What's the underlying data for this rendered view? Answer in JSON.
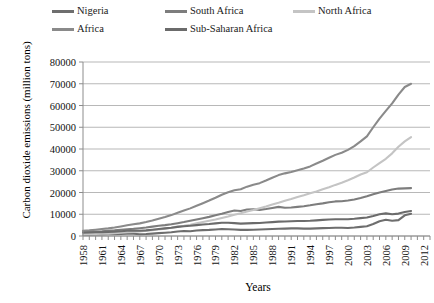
{
  "chart_data": {
    "type": "line",
    "title": "",
    "xlabel": "Years",
    "ylabel": "Carbon dioxide emissions (million tons)",
    "ylim": [
      0,
      80000
    ],
    "ytick_labels": [
      "80000",
      "70000",
      "60000",
      "50000",
      "40000",
      "30000",
      "20000",
      "10000",
      "0"
    ],
    "ytick_values": [
      80000,
      70000,
      60000,
      50000,
      40000,
      30000,
      20000,
      10000,
      0
    ],
    "xlim": [
      1958,
      2013
    ],
    "xtick_labels": [
      "1958",
      "1961",
      "1964",
      "1967",
      "1970",
      "1973",
      "1976",
      "1979",
      "1982",
      "1985",
      "1988",
      "1991",
      "1994",
      "1997",
      "2000",
      "2003",
      "2006",
      "2009",
      "2012"
    ],
    "xtick_values": [
      1958,
      1961,
      1964,
      1967,
      1970,
      1973,
      1976,
      1979,
      1982,
      1985,
      1988,
      1991,
      1994,
      1997,
      2000,
      2003,
      2006,
      2009,
      2012
    ],
    "grid": "horizontal",
    "legend_position": "top",
    "x": [
      1958,
      1959,
      1960,
      1961,
      1962,
      1963,
      1964,
      1965,
      1966,
      1967,
      1968,
      1969,
      1970,
      1971,
      1972,
      1973,
      1974,
      1975,
      1976,
      1977,
      1978,
      1979,
      1980,
      1981,
      1982,
      1983,
      1984,
      1985,
      1986,
      1987,
      1988,
      1989,
      1990,
      1991,
      1992,
      1993,
      1994,
      1995,
      1996,
      1997,
      1998,
      1999,
      2000,
      2001,
      2002,
      2003,
      2004,
      2005,
      2006,
      2007,
      2008,
      2009,
      2010
    ],
    "series": [
      {
        "name": "Nigeria",
        "color": "#6e6e6e",
        "values": [
          600,
          650,
          700,
          750,
          800,
          850,
          900,
          1000,
          1000,
          800,
          900,
          1100,
          1300,
          1500,
          1700,
          2100,
          2300,
          2200,
          2500,
          2700,
          2800,
          3000,
          3200,
          3100,
          3000,
          2800,
          2800,
          2900,
          3000,
          3100,
          3200,
          3300,
          3400,
          3500,
          3500,
          3400,
          3400,
          3500,
          3600,
          3700,
          3800,
          3800,
          3700,
          3900,
          4200,
          4500,
          5500,
          6800,
          7500,
          7000,
          7300,
          9500,
          10200
        ]
      },
      {
        "name": "South Africa",
        "color": "#7d7d7d",
        "values": [
          1900,
          2000,
          2100,
          2200,
          2400,
          2600,
          2900,
          3100,
          3300,
          3600,
          3900,
          4300,
          4700,
          5000,
          5400,
          5900,
          6400,
          7000,
          7600,
          8200,
          8800,
          9500,
          10200,
          11000,
          11700,
          11500,
          12200,
          12300,
          12000,
          12400,
          12900,
          13400,
          13000,
          13100,
          13400,
          13700,
          14100,
          14600,
          15000,
          15500,
          15900,
          16000,
          16300,
          16800,
          17500,
          18300,
          19200,
          20000,
          20700,
          21400,
          21800,
          21900,
          22000
        ]
      },
      {
        "name": "North Africa",
        "color": "#c4c4c4",
        "values": [
          700,
          800,
          900,
          1000,
          1100,
          1300,
          1500,
          1700,
          1900,
          2100,
          2400,
          2700,
          3000,
          3400,
          3800,
          4300,
          4700,
          5200,
          5800,
          6400,
          7000,
          7600,
          8300,
          9000,
          9800,
          10500,
          11300,
          12000,
          12800,
          13600,
          14500,
          15300,
          16200,
          17000,
          17900,
          18700,
          19600,
          20500,
          21500,
          22400,
          23500,
          24500,
          25600,
          26900,
          28300,
          29300,
          31500,
          33500,
          35500,
          38000,
          41000,
          43500,
          45500
        ]
      },
      {
        "name": "Africa",
        "color": "#8a8a8a",
        "values": [
          2400,
          2600,
          2900,
          3200,
          3500,
          3900,
          4400,
          4900,
          5400,
          5800,
          6400,
          7100,
          7900,
          8700,
          9600,
          10700,
          11700,
          12700,
          13900,
          15100,
          16300,
          17600,
          19000,
          20100,
          21000,
          21500,
          22700,
          23600,
          24300,
          25500,
          26800,
          28000,
          28800,
          29400,
          30200,
          31000,
          32000,
          33300,
          34600,
          36000,
          37300,
          38300,
          39600,
          41300,
          43500,
          45800,
          50000,
          54000,
          57500,
          61000,
          65000,
          68500,
          70000
        ]
      },
      {
        "name": "Sub-Saharan Africa",
        "color": "#6b6b6b",
        "values": [
          1500,
          1600,
          1700,
          1800,
          1900,
          2000,
          2200,
          2400,
          2500,
          2400,
          2600,
          2900,
          3200,
          3500,
          3800,
          4200,
          4500,
          4700,
          5000,
          5300,
          5500,
          5800,
          6100,
          6100,
          5900,
          5700,
          5800,
          5900,
          6000,
          6200,
          6400,
          6600,
          6700,
          6800,
          6900,
          6900,
          7000,
          7200,
          7400,
          7600,
          7700,
          7700,
          7700,
          7900,
          8200,
          8500,
          9200,
          10000,
          10400,
          10000,
          10300,
          11000,
          11500
        ]
      }
    ]
  },
  "legend": {
    "items": [
      {
        "label": "Nigeria",
        "color": "#6e6e6e"
      },
      {
        "label": "South Africa",
        "color": "#7d7d7d"
      },
      {
        "label": "North Africa",
        "color": "#c4c4c4"
      },
      {
        "label": "Africa",
        "color": "#8a8a8a"
      },
      {
        "label": "Sub-Saharan Africa",
        "color": "#6b6b6b"
      }
    ]
  },
  "axes": {
    "y_title": "Carbon dioxide emissions (million tons)",
    "x_title": "Years"
  }
}
